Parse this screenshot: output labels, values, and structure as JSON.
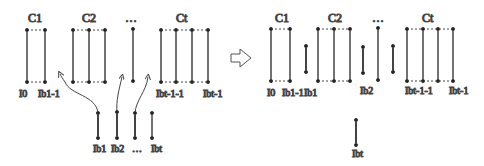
{
  "left": {
    "clusters": [
      {
        "label": "C1"
      },
      {
        "label": "C2"
      },
      {
        "label": "…"
      },
      {
        "label": "Ct"
      }
    ],
    "labels": {
      "i0": "I0",
      "ib1m1": "Ib1-1",
      "ibt1m1": "Ibt-1-1",
      "ibtm1": "Ibt-1"
    },
    "bottom": {
      "ib1": "Ib1",
      "ib2": "Ib2",
      "dots": "…",
      "ibt": "Ibt"
    }
  },
  "arrow": {
    "icon": "right-outline-arrow-icon"
  },
  "right": {
    "clusters": [
      {
        "label": "C1"
      },
      {
        "label": "C2"
      },
      {
        "label": "…"
      },
      {
        "label": "Ct"
      }
    ],
    "labels": {
      "i0": "I0",
      "ib1m1": "Ib1-1",
      "ib1": "Ib1",
      "ib2": "Ib2",
      "ibt1m1": "Ibt-1-1",
      "ibtm1": "Ibt-1",
      "ibt": "Ibt"
    }
  }
}
